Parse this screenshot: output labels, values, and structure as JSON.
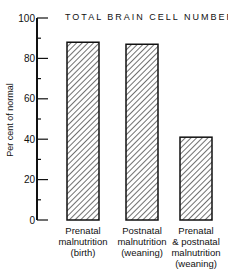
{
  "chart_data": {
    "type": "bar",
    "title": "TOTAL BRAIN CELL NUMBER",
    "xlabel": "",
    "ylabel": "Per cent of normal",
    "ylim": [
      0,
      100
    ],
    "yticks": [
      0,
      20,
      40,
      60,
      80,
      100
    ],
    "grid": false,
    "legend": null,
    "categories": [
      "Prenatal malnutrition (birth)",
      "Postnatal malnutrition (weaning)",
      "Prenatal & postnatal malnutrition (weaning)"
    ],
    "category_lines": [
      [
        "Prenatal",
        "malnutrition",
        "(birth)"
      ],
      [
        "Postnatal",
        "malnutrition",
        "(weaning)"
      ],
      [
        "Prenatal",
        "& postnatal",
        "malnutrition",
        "(weaning)"
      ]
    ],
    "values": [
      88,
      87,
      41
    ],
    "bar_fill": "diagonal hatch"
  }
}
